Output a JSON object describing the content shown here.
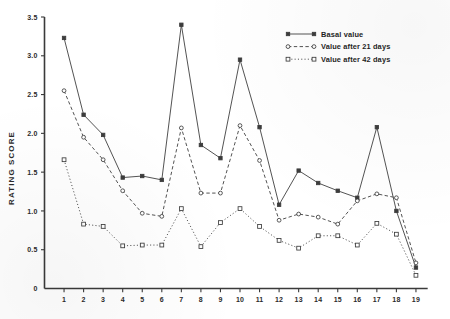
{
  "chart_data": {
    "type": "line",
    "title": "",
    "xlabel": "",
    "ylabel": "RATING  SCORE",
    "xlim": [
      0,
      19.6
    ],
    "ylim": [
      0,
      3.5
    ],
    "ytick_values": [
      0,
      0.5,
      1.0,
      1.5,
      2.0,
      2.5,
      3.0,
      3.5
    ],
    "ytick_labels": [
      "0",
      "0.5",
      "1.0",
      "1.5",
      "2.0",
      "2.5",
      "3.0",
      "3.5"
    ],
    "x": [
      1,
      2,
      3,
      4,
      5,
      6,
      7,
      8,
      9,
      10,
      11,
      12,
      13,
      14,
      15,
      16,
      17,
      18,
      19
    ],
    "xtick_labels": [
      "1",
      "2",
      "3",
      "4",
      "5",
      "6",
      "7",
      "8",
      "9",
      "10",
      "11",
      "12",
      "13",
      "14",
      "15",
      "16",
      "17",
      "18",
      "19"
    ],
    "grid": false,
    "legend_position": "top-right",
    "series": [
      {
        "name": "Basal value",
        "marker": "filled-square",
        "linestyle": "solid",
        "values": [
          3.23,
          2.24,
          1.98,
          1.43,
          1.45,
          1.4,
          3.4,
          1.85,
          1.68,
          2.95,
          2.08,
          1.08,
          1.52,
          1.36,
          1.26,
          1.17,
          2.08,
          1.0,
          0.27
        ]
      },
      {
        "name": "Value after 21 days",
        "marker": "open-circle",
        "linestyle": "dashed",
        "values": [
          2.55,
          1.95,
          1.66,
          1.26,
          0.97,
          0.93,
          2.07,
          1.23,
          1.23,
          2.1,
          1.65,
          0.88,
          0.96,
          0.92,
          0.83,
          1.13,
          1.22,
          1.17,
          0.33
        ]
      },
      {
        "name": "Value after 42 days",
        "marker": "open-square",
        "linestyle": "dotted",
        "values": [
          1.66,
          0.83,
          0.8,
          0.55,
          0.56,
          0.56,
          1.03,
          0.54,
          0.85,
          1.03,
          0.8,
          0.62,
          0.52,
          0.68,
          0.68,
          0.56,
          0.84,
          0.7,
          0.17
        ]
      }
    ],
    "legend": [
      {
        "label": "Basal value"
      },
      {
        "label": "Value after 21 days"
      },
      {
        "label": "Value after 42 days"
      }
    ],
    "colors": {
      "ink": "#3c3c3c",
      "axis": "#3a3a3a",
      "background": "#ffffff"
    }
  }
}
